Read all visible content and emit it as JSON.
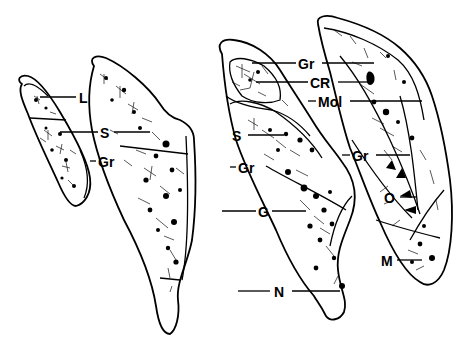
{
  "diagram": {
    "type": "histological line drawing",
    "background": "#ffffff",
    "ink": "#000000",
    "sections": [
      {
        "id": 1,
        "name": "section-1",
        "labels": [
          "L",
          "S",
          "Gr"
        ]
      },
      {
        "id": 2,
        "name": "section-2",
        "labels": [
          "S",
          "Gr",
          "G",
          "N"
        ]
      },
      {
        "id": 3,
        "name": "section-3",
        "labels": [
          "Gr",
          "CR",
          "Mol",
          "S",
          "Gr",
          "G",
          "N"
        ]
      },
      {
        "id": 4,
        "name": "section-4",
        "labels": [
          "Gr",
          "CR",
          "Mol",
          "Gr",
          "O",
          "M"
        ]
      }
    ],
    "labels": {
      "L": "L",
      "S1": "S",
      "Gr1": "Gr",
      "Gr2": "Gr",
      "G": "G",
      "N": "N",
      "S3": "S",
      "Gr_top": "Gr",
      "CR": "CR",
      "Mol": "Mol",
      "Gr4": "Gr",
      "O": "O",
      "M": "M"
    }
  }
}
